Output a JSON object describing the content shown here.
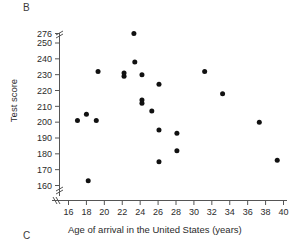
{
  "figure": {
    "panel_label": "B",
    "next_panel_label": "C"
  },
  "chart_data": {
    "type": "scatter",
    "title": "",
    "xlabel": "Age of arrival in the United States (years)",
    "ylabel": "Test score",
    "xlim": [
      16,
      40
    ],
    "ylim": [
      155,
      276
    ],
    "grid": false,
    "legend": "none",
    "x_ticks": [
      16,
      18,
      20,
      22,
      24,
      26,
      28,
      30,
      32,
      34,
      36,
      38,
      40
    ],
    "y_ticks": [
      160,
      170,
      180,
      190,
      200,
      210,
      220,
      230,
      240,
      250,
      276
    ],
    "y_axis_break": {
      "present": true,
      "between": [
        250,
        276
      ],
      "lower_break_below": 160
    },
    "x_axis_break": {
      "present": true,
      "before": 16
    },
    "marker": "filled-circle",
    "marker_color": "#111111",
    "n_points": 24,
    "points": [
      {
        "x": 17.0,
        "y": 201
      },
      {
        "x": 18.0,
        "y": 205
      },
      {
        "x": 18.2,
        "y": 163
      },
      {
        "x": 19.1,
        "y": 201
      },
      {
        "x": 19.3,
        "y": 232
      },
      {
        "x": 22.2,
        "y": 231
      },
      {
        "x": 22.2,
        "y": 229
      },
      {
        "x": 23.3,
        "y": 256
      },
      {
        "x": 23.4,
        "y": 238
      },
      {
        "x": 24.2,
        "y": 230
      },
      {
        "x": 24.2,
        "y": 214
      },
      {
        "x": 24.2,
        "y": 212
      },
      {
        "x": 25.3,
        "y": 207
      },
      {
        "x": 26.1,
        "y": 224
      },
      {
        "x": 26.1,
        "y": 195
      },
      {
        "x": 26.1,
        "y": 175
      },
      {
        "x": 28.1,
        "y": 193
      },
      {
        "x": 28.1,
        "y": 182
      },
      {
        "x": 31.2,
        "y": 232
      },
      {
        "x": 33.2,
        "y": 218
      },
      {
        "x": 37.3,
        "y": 200
      },
      {
        "x": 39.3,
        "y": 176
      }
    ]
  }
}
